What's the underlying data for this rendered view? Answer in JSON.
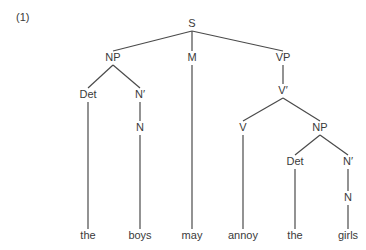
{
  "example_number": "(1)",
  "tree": {
    "nodes": [
      {
        "id": "S",
        "label": "S",
        "x": 192,
        "y": 24
      },
      {
        "id": "NP1",
        "label": "NP",
        "x": 113,
        "y": 58
      },
      {
        "id": "M",
        "label": "M",
        "x": 192,
        "y": 58
      },
      {
        "id": "VP",
        "label": "VP",
        "x": 283,
        "y": 58
      },
      {
        "id": "Det1",
        "label": "Det",
        "x": 88,
        "y": 95
      },
      {
        "id": "Nb1",
        "label": "N′",
        "x": 140,
        "y": 95
      },
      {
        "id": "N1",
        "label": "N",
        "x": 140,
        "y": 128
      },
      {
        "id": "Vb",
        "label": "V′",
        "x": 283,
        "y": 91
      },
      {
        "id": "V",
        "label": "V",
        "x": 243,
        "y": 128
      },
      {
        "id": "NP2",
        "label": "NP",
        "x": 320,
        "y": 128
      },
      {
        "id": "Det2",
        "label": "Det",
        "x": 295,
        "y": 162
      },
      {
        "id": "Nb2",
        "label": "N′",
        "x": 348,
        "y": 162
      },
      {
        "id": "N2",
        "label": "N",
        "x": 348,
        "y": 198
      }
    ],
    "leaves": [
      {
        "id": "w1",
        "label": "the",
        "x": 88,
        "y": 236
      },
      {
        "id": "w2",
        "label": "boys",
        "x": 140,
        "y": 236
      },
      {
        "id": "w3",
        "label": "may",
        "x": 192,
        "y": 236
      },
      {
        "id": "w4",
        "label": "annoy",
        "x": 243,
        "y": 236
      },
      {
        "id": "w5",
        "label": "the",
        "x": 295,
        "y": 236
      },
      {
        "id": "w6",
        "label": "girls",
        "x": 348,
        "y": 236
      }
    ],
    "edges": [
      {
        "from": "S",
        "to": "NP1"
      },
      {
        "from": "S",
        "to": "M"
      },
      {
        "from": "S",
        "to": "VP"
      },
      {
        "from": "NP1",
        "to": "Det1"
      },
      {
        "from": "NP1",
        "to": "Nb1"
      },
      {
        "from": "Nb1",
        "to": "N1"
      },
      {
        "from": "VP",
        "to": "Vb"
      },
      {
        "from": "Vb",
        "to": "V"
      },
      {
        "from": "Vb",
        "to": "NP2"
      },
      {
        "from": "NP2",
        "to": "Det2"
      },
      {
        "from": "NP2",
        "to": "Nb2"
      },
      {
        "from": "Nb2",
        "to": "N2"
      },
      {
        "from": "Det1",
        "to": "w1"
      },
      {
        "from": "N1",
        "to": "w2"
      },
      {
        "from": "M",
        "to": "w3"
      },
      {
        "from": "V",
        "to": "w4"
      },
      {
        "from": "Det2",
        "to": "w5"
      },
      {
        "from": "N2",
        "to": "w6"
      }
    ],
    "sentence": "the boys may annoy the girls"
  }
}
